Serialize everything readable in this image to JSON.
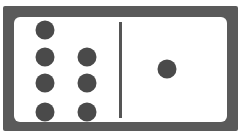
{
  "domino": {
    "left_half": {
      "value": 7,
      "pips": [
        {
          "x": 31,
          "y": 13
        },
        {
          "x": 31,
          "y": 40
        },
        {
          "x": 73,
          "y": 40
        },
        {
          "x": 31,
          "y": 66
        },
        {
          "x": 73,
          "y": 66
        },
        {
          "x": 31,
          "y": 95
        },
        {
          "x": 73,
          "y": 95
        }
      ]
    },
    "right_half": {
      "value": 1,
      "pips": [
        {
          "x": 153,
          "y": 52
        }
      ]
    },
    "colors": {
      "frame": "#5a5a5a",
      "face": "#ffffff",
      "pip": "#4a4a4a",
      "divider": "#555555"
    }
  }
}
